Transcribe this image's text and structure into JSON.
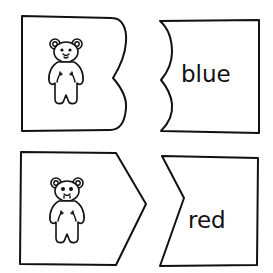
{
  "puzzle": {
    "pairs": [
      {
        "picture_piece": {
          "icon": "teddy-bear-icon",
          "edge_shape": "double-curve"
        },
        "word_piece": {
          "word": "blue",
          "edge_shape": "double-curve-notch"
        }
      },
      {
        "picture_piece": {
          "icon": "teddy-bear-icon",
          "edge_shape": "arrow-point"
        },
        "word_piece": {
          "word": "red",
          "edge_shape": "arrow-notch"
        }
      }
    ]
  },
  "colors": {
    "background": "#ffffff",
    "stroke": "#111111"
  }
}
